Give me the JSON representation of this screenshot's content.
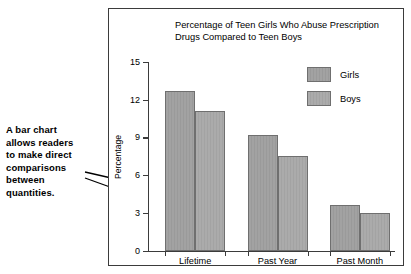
{
  "annotation": {
    "lines": [
      "A bar chart",
      "allows readers",
      "to make direct",
      "comparisons",
      "between",
      "quantities."
    ]
  },
  "chart_data": {
    "type": "bar",
    "title": "Percentage of Teen Girls Who Abuse Prescription Drugs Compared to Teen Boys",
    "title_lines": [
      "Percentage of Teen Girls Who Abuse Prescription",
      "Drugs Compared to Teen Boys"
    ],
    "categories": [
      "Lifetime",
      "Past Year",
      "Past Month"
    ],
    "series": [
      {
        "name": "Girls",
        "values": [
          12.7,
          9.2,
          3.6
        ],
        "color": "#9e9e9e"
      },
      {
        "name": "Boys",
        "values": [
          11.1,
          7.5,
          3.0
        ],
        "color": "#a8a8a8"
      }
    ],
    "xlabel": "",
    "ylabel": "Percentage",
    "ylim": [
      0,
      15
    ],
    "yticks": [
      0,
      3,
      6,
      9,
      12,
      15
    ],
    "grid": false,
    "legend_position": "top-right"
  }
}
